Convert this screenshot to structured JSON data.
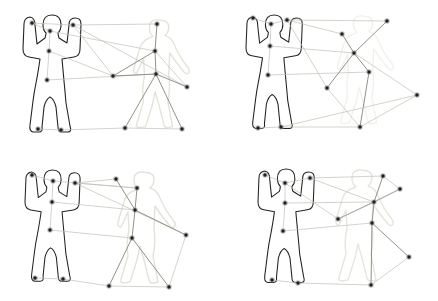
{
  "figure": {
    "width": 438,
    "height": 301,
    "background": "#ffffff",
    "colors": {
      "silhouette_stroke": "#232323",
      "silhouette_fill": "#ffffff",
      "ghost_stroke": "#e3e3d9",
      "edge": "#c0c0b6",
      "edge_strong": "#8f948a",
      "node_core": "#241e1e",
      "node_halo": "#8f8f8f"
    },
    "panels": [
      {
        "id": "top-left",
        "nodes": [
          [
            32,
            23
          ],
          [
            50,
            31
          ],
          [
            73,
            25
          ],
          [
            49,
            51
          ],
          [
            47,
            80
          ],
          [
            38,
            129
          ],
          [
            61,
            130
          ],
          [
            157,
            24
          ],
          [
            155,
            51
          ],
          [
            113,
            76
          ],
          [
            156,
            74
          ],
          [
            187,
            87
          ],
          [
            125,
            128
          ],
          [
            182,
            129
          ]
        ],
        "edges": [
          [
            0,
            1,
            0
          ],
          [
            0,
            2,
            0
          ],
          [
            2,
            7,
            0
          ],
          [
            1,
            3,
            0
          ],
          [
            3,
            4,
            0
          ],
          [
            4,
            10,
            0
          ],
          [
            5,
            6,
            0
          ],
          [
            6,
            12,
            0
          ],
          [
            12,
            13,
            0
          ],
          [
            2,
            9,
            0
          ],
          [
            3,
            9,
            0
          ],
          [
            2,
            11,
            0
          ],
          [
            1,
            8,
            0
          ],
          [
            7,
            8,
            1
          ],
          [
            8,
            9,
            1
          ],
          [
            9,
            10,
            1
          ],
          [
            8,
            10,
            1
          ],
          [
            10,
            11,
            1
          ],
          [
            10,
            12,
            1
          ],
          [
            10,
            13,
            1
          ],
          [
            8,
            11,
            0
          ]
        ],
        "silhouette": {
          "tx": 23,
          "ty": 15,
          "s": 1.0
        },
        "ghost": {
          "tx": 128,
          "ty": 18,
          "s": 0.97,
          "opacity": 1.0
        }
      },
      {
        "id": "top-right",
        "nodes": [
          [
            253,
            18
          ],
          [
            271,
            24
          ],
          [
            287,
            20
          ],
          [
            270,
            46
          ],
          [
            268,
            75
          ],
          [
            258,
            128
          ],
          [
            281,
            127
          ],
          [
            387,
            21
          ],
          [
            342,
            34
          ],
          [
            354,
            53
          ],
          [
            369,
            72
          ],
          [
            327,
            88
          ],
          [
            417,
            95
          ],
          [
            360,
            127
          ]
        ],
        "edges": [
          [
            0,
            1,
            0
          ],
          [
            1,
            2,
            0
          ],
          [
            2,
            7,
            0
          ],
          [
            2,
            8,
            0
          ],
          [
            2,
            11,
            0
          ],
          [
            1,
            3,
            0
          ],
          [
            3,
            4,
            0
          ],
          [
            3,
            9,
            0
          ],
          [
            4,
            10,
            0
          ],
          [
            7,
            9,
            1
          ],
          [
            8,
            9,
            1
          ],
          [
            9,
            10,
            1
          ],
          [
            9,
            11,
            1
          ],
          [
            9,
            12,
            0
          ],
          [
            10,
            13,
            1
          ],
          [
            11,
            13,
            0
          ],
          [
            5,
            6,
            0
          ],
          [
            6,
            13,
            0
          ],
          [
            6,
            12,
            0
          ],
          [
            12,
            13,
            0
          ]
        ],
        "silhouette": {
          "tx": 246,
          "ty": 15,
          "s": 0.97
        },
        "ghost": {
          "tx": 332,
          "ty": 14,
          "s": 0.97,
          "opacity": 0.5
        }
      },
      {
        "id": "bottom-left",
        "nodes": [
          [
            32,
            175
          ],
          [
            53,
            181
          ],
          [
            75,
            183
          ],
          [
            52,
            202
          ],
          [
            50,
            230
          ],
          [
            35,
            278
          ],
          [
            63,
            279
          ],
          [
            116,
            179
          ],
          [
            137,
            188
          ],
          [
            135,
            210
          ],
          [
            186,
            235
          ],
          [
            132,
            238
          ],
          [
            109,
            286
          ],
          [
            169,
            287
          ]
        ],
        "edges": [
          [
            0,
            1,
            0
          ],
          [
            2,
            7,
            0
          ],
          [
            1,
            8,
            0
          ],
          [
            2,
            8,
            0
          ],
          [
            2,
            10,
            0
          ],
          [
            1,
            3,
            0
          ],
          [
            3,
            4,
            0
          ],
          [
            3,
            9,
            0
          ],
          [
            4,
            11,
            0
          ],
          [
            7,
            9,
            1
          ],
          [
            8,
            9,
            1
          ],
          [
            9,
            11,
            1
          ],
          [
            9,
            10,
            1
          ],
          [
            11,
            12,
            1
          ],
          [
            11,
            13,
            1
          ],
          [
            12,
            13,
            0
          ],
          [
            5,
            6,
            0
          ],
          [
            6,
            12,
            0
          ],
          [
            10,
            13,
            0
          ]
        ],
        "silhouette": {
          "tx": 25,
          "ty": 170,
          "s": 0.95
        },
        "ghost": {
          "tx": 112,
          "ty": 170,
          "s": 1.0,
          "opacity": 1.0
        }
      },
      {
        "id": "bottom-right",
        "nodes": [
          [
            265,
            175
          ],
          [
            285,
            183
          ],
          [
            310,
            178
          ],
          [
            285,
            203
          ],
          [
            283,
            231
          ],
          [
            272,
            280
          ],
          [
            298,
            283
          ],
          [
            383,
            176
          ],
          [
            400,
            189
          ],
          [
            374,
            202
          ],
          [
            338,
            219
          ],
          [
            372,
            223
          ],
          [
            409,
            257
          ],
          [
            371,
            285
          ]
        ],
        "edges": [
          [
            0,
            1,
            0
          ],
          [
            1,
            2,
            0
          ],
          [
            2,
            7,
            0
          ],
          [
            7,
            8,
            0
          ],
          [
            2,
            9,
            0
          ],
          [
            1,
            10,
            0
          ],
          [
            1,
            3,
            0
          ],
          [
            3,
            4,
            0
          ],
          [
            3,
            9,
            0
          ],
          [
            4,
            11,
            0
          ],
          [
            7,
            9,
            1
          ],
          [
            8,
            9,
            1
          ],
          [
            9,
            10,
            1
          ],
          [
            8,
            10,
            0
          ],
          [
            9,
            11,
            1
          ],
          [
            11,
            12,
            1
          ],
          [
            11,
            13,
            1
          ],
          [
            12,
            13,
            0
          ],
          [
            5,
            6,
            0
          ],
          [
            6,
            13,
            0
          ]
        ],
        "silhouette": {
          "tx": 258,
          "ty": 169,
          "s": 0.97
        },
        "ghost": {
          "tx": 330,
          "ty": 168,
          "s": 1.0,
          "opacity": 0.9
        }
      }
    ]
  }
}
